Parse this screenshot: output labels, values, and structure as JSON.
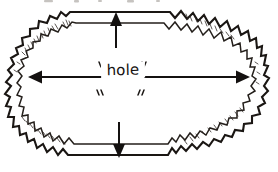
{
  "figure": {
    "kind": "hand-drawn-diagram",
    "background_color": "#ffffff",
    "ink_color": "#1a1613",
    "width_px": 278,
    "height_px": 172,
    "label": {
      "text": "hole",
      "quoted": true,
      "open_quote": "“",
      "close_quote": "”"
    },
    "annotations": {
      "horizontal_measure": {
        "name": "hole-width-arrow",
        "style": "double-headed",
        "label": "hole",
        "y_px": 77,
        "x_start_px": 30,
        "x_end_px": 248
      },
      "top_measure": {
        "name": "top-thickness-arrow",
        "style": "single-headed-up",
        "x_px": 116,
        "y_tip_px": 14,
        "y_tail_px": 48
      },
      "bottom_measure": {
        "name": "bottom-thickness-arrow",
        "style": "single-headed-down",
        "x_px": 119,
        "y_tip_px": 157,
        "y_tail_px": 122
      }
    },
    "edges": {
      "top_rim": "smooth horizontal double line",
      "bottom_rim": "smooth horizontal double line",
      "left_rim": "jagged torn double zigzag",
      "right_rim": "jagged torn double zigzag",
      "hatching": "short cross strokes between the two rim lines"
    }
  }
}
